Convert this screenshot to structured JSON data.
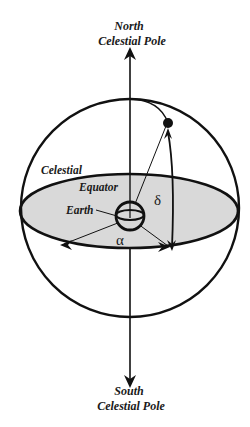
{
  "diagram": {
    "labels": {
      "north_line1": "North",
      "north_line2": "Celestial Pole",
      "south_line1": "South",
      "south_line2": "Celestial Pole",
      "celestial": "Celestial",
      "equator": "Equator",
      "earth": "Earth",
      "delta": "δ",
      "alpha": "α"
    },
    "colors": {
      "stroke": "#111111",
      "equator_fill": "#d9d9d9",
      "background": "#ffffff"
    },
    "elements": {
      "celestial_sphere": {
        "cx": 130,
        "cy": 208,
        "r": 109
      },
      "equatorial_plane": {
        "cx": 129,
        "cy": 211,
        "rx": 109,
        "ry": 37
      },
      "earth": {
        "cx": 130,
        "cy": 216,
        "r": 15
      },
      "polar_axis": {
        "x": 130,
        "y_top": 47,
        "y_bottom": 386
      },
      "star": {
        "x": 168,
        "y": 123
      }
    }
  }
}
